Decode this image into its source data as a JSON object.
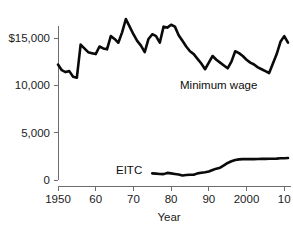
{
  "chart_data": {
    "type": "line",
    "title": "",
    "xlabel": "Year",
    "ylabel": "",
    "xlim": [
      1950,
      2011
    ],
    "ylim": [
      0,
      19000
    ],
    "grid": false,
    "legend_position": "inline-labels",
    "y_ticks": [
      {
        "value": 0,
        "label": "0"
      },
      {
        "value": 5000,
        "label": "5,000"
      },
      {
        "value": 10000,
        "label": "10,000"
      },
      {
        "value": 15000,
        "label": "$15,000"
      }
    ],
    "x_ticks": [
      {
        "value": 1950,
        "label": "1950"
      },
      {
        "value": 1960,
        "label": "60"
      },
      {
        "value": 1970,
        "label": "70"
      },
      {
        "value": 1980,
        "label": "80"
      },
      {
        "value": 1990,
        "label": "90"
      },
      {
        "value": 2000,
        "label": "2000"
      },
      {
        "value": 2010,
        "label": "10"
      }
    ],
    "series": [
      {
        "name": "Minimum wage",
        "label": "Minimum wage",
        "color": "#0a0a0a",
        "x": [
          1950,
          1951,
          1952,
          1953,
          1954,
          1955,
          1956,
          1957,
          1958,
          1959,
          1960,
          1961,
          1962,
          1963,
          1964,
          1965,
          1966,
          1967,
          1968,
          1969,
          1970,
          1971,
          1972,
          1973,
          1974,
          1975,
          1976,
          1977,
          1978,
          1979,
          1980,
          1981,
          1982,
          1983,
          1984,
          1985,
          1986,
          1987,
          1988,
          1989,
          1990,
          1991,
          1992,
          1993,
          1994,
          1995,
          1996,
          1997,
          1998,
          1999,
          2000,
          2001,
          2002,
          2003,
          2004,
          2005,
          2006,
          2007,
          2008,
          2009,
          2010,
          2011
        ],
        "values": [
          12200,
          11600,
          11400,
          11500,
          10900,
          10800,
          14300,
          13900,
          13500,
          13400,
          13300,
          14100,
          13900,
          13800,
          15200,
          14900,
          14500,
          15600,
          17000,
          16200,
          15400,
          14700,
          14200,
          13500,
          14900,
          15400,
          15200,
          14500,
          16200,
          16100,
          16400,
          16200,
          15300,
          14700,
          14100,
          13600,
          13300,
          12800,
          12300,
          11700,
          12400,
          13100,
          12700,
          12400,
          12100,
          11800,
          12500,
          13600,
          13400,
          13100,
          12700,
          12400,
          12200,
          11900,
          11700,
          11500,
          11300,
          12300,
          13300,
          14600,
          15200,
          14500
        ]
      },
      {
        "name": "EITC",
        "label": "EITC",
        "color": "#0a0a0a",
        "x": [
          1975,
          1976,
          1977,
          1978,
          1979,
          1980,
          1981,
          1982,
          1983,
          1984,
          1985,
          1986,
          1987,
          1988,
          1989,
          1990,
          1991,
          1992,
          1993,
          1994,
          1995,
          1996,
          1997,
          1998,
          1999,
          2000,
          2001,
          2002,
          2003,
          2004,
          2005,
          2006,
          2007,
          2008,
          2009,
          2010,
          2011
        ],
        "values": [
          700,
          670,
          640,
          620,
          750,
          700,
          640,
          580,
          470,
          520,
          560,
          560,
          700,
          760,
          820,
          900,
          1050,
          1200,
          1300,
          1550,
          1800,
          1980,
          2120,
          2180,
          2200,
          2200,
          2200,
          2210,
          2220,
          2230,
          2230,
          2240,
          2250,
          2260,
          2290,
          2300,
          2320
        ]
      }
    ],
    "annotations": [
      {
        "text": "Minimum wage",
        "x_px": 180,
        "y_px": 89
      },
      {
        "text": "EITC",
        "x_px": 116,
        "y_px": 174
      }
    ]
  },
  "axis": {
    "x_title": "Year"
  }
}
